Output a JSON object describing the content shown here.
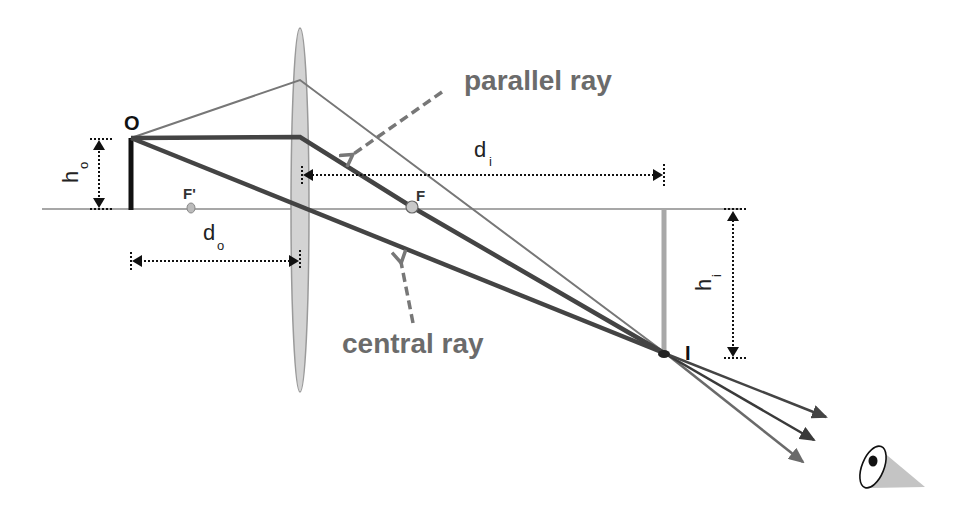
{
  "diagram": {
    "type": "thin converging lens ray diagram",
    "labels": {
      "object": "O",
      "image": "I",
      "focal_near": "F'",
      "focal_far": "F",
      "object_height": "h",
      "object_height_sub": "o",
      "image_height": "h",
      "image_height_sub": "i",
      "object_distance": "d",
      "object_distance_sub": "o",
      "image_distance": "d",
      "image_distance_sub": "i"
    },
    "annotations": {
      "parallel_ray": "parallel ray",
      "central_ray": "central ray"
    },
    "colors": {
      "axis": "#888888",
      "lens_fill": "#d3d3d3",
      "lens_stroke": "#9a9a9a",
      "object": "#111111",
      "image": "#a8a8a8",
      "ray_thick": "#444444",
      "ray_thin": "#777777",
      "annotation_text": "#6b6b6b",
      "dim_lines": "#111111"
    },
    "observer": "eye-icon"
  }
}
